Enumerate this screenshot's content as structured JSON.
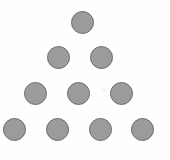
{
  "figure": {
    "background_color": "#fefefe",
    "width": 170,
    "height": 160,
    "shape_count": 10,
    "row_count": 4,
    "circle_fill_color": "#9b9b9b",
    "circle_stroke_color": "#6e6e6e",
    "circle_diameter": 23
  },
  "chart_data": {
    "type": "scatter",
    "subtitle": "",
    "xlabel": "",
    "ylabel": "",
    "xlim": [
      0,
      170
    ],
    "ylim": [
      0,
      160
    ],
    "grid": false,
    "legend": "none",
    "marker": "circle",
    "marker_size": 23,
    "marker_fill": "#9b9b9b",
    "marker_edge": "#6e6e6e",
    "rows": [
      {
        "row": 1,
        "count": 1
      },
      {
        "row": 2,
        "count": 2
      },
      {
        "row": 3,
        "count": 3
      },
      {
        "row": 4,
        "count": 4
      }
    ],
    "points": [
      {
        "id": "c1",
        "row": 1,
        "index": 1,
        "x": 82.5,
        "y": 22.5
      },
      {
        "id": "c2",
        "row": 2,
        "index": 1,
        "x": 58.5,
        "y": 57.5
      },
      {
        "id": "c3",
        "row": 2,
        "index": 2,
        "x": 101.5,
        "y": 57.5
      },
      {
        "id": "c4",
        "row": 3,
        "index": 1,
        "x": 35.5,
        "y": 93.5
      },
      {
        "id": "c5",
        "row": 3,
        "index": 2,
        "x": 78.5,
        "y": 93.5
      },
      {
        "id": "c6",
        "row": 3,
        "index": 3,
        "x": 121.5,
        "y": 93.5
      },
      {
        "id": "c7",
        "row": 4,
        "index": 1,
        "x": 14.5,
        "y": 129.5
      },
      {
        "id": "c8",
        "row": 4,
        "index": 2,
        "x": 57.5,
        "y": 129.5
      },
      {
        "id": "c9",
        "row": 4,
        "index": 3,
        "x": 100.5,
        "y": 129.5
      },
      {
        "id": "c10",
        "row": 4,
        "index": 4,
        "x": 142.5,
        "y": 129.5
      }
    ],
    "annotations": [
      {
        "id": "speck",
        "type": "artifact",
        "x": 103,
        "y": 90,
        "color": "#f3f3f3"
      }
    ]
  }
}
